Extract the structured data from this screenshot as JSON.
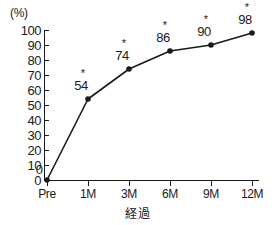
{
  "chart_data": {
    "type": "line",
    "title": "",
    "xlabel": "経過",
    "ylabel": "(%)",
    "categories": [
      "Pre",
      "1M",
      "3M",
      "6M",
      "9M",
      "12M"
    ],
    "values": [
      0,
      54,
      74,
      86,
      90,
      98
    ],
    "point_labels": [
      "0",
      "54",
      "74",
      "86",
      "90",
      "98"
    ],
    "significance_marks": [
      "",
      "*",
      "*",
      "*",
      "*",
      "*"
    ],
    "ylim": [
      0,
      100
    ],
    "y_ticks": [
      0,
      10,
      20,
      30,
      40,
      50,
      60,
      70,
      80,
      90,
      100
    ],
    "y_tick_labels": [
      "0",
      "10",
      "20",
      "30",
      "40",
      "50",
      "60",
      "70",
      "80",
      "90",
      "100"
    ],
    "grid": false,
    "legend": "none",
    "series_color": "#1a1a1a",
    "marker": "circle",
    "background": "#ffffff"
  }
}
